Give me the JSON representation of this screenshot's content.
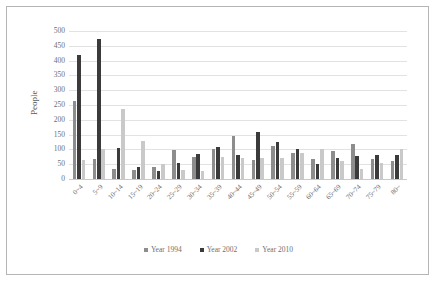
{
  "chart_data": {
    "type": "bar",
    "title": "",
    "xlabel": "",
    "ylabel": "People",
    "ylim": [
      0,
      500
    ],
    "yticks": [
      500,
      450,
      400,
      350,
      300,
      250,
      200,
      150,
      100,
      50,
      0
    ],
    "grid": true,
    "legend_position": "bottom-center",
    "categories": [
      "0~4",
      "5~9",
      "10~14",
      "15~19",
      "20~24",
      "25~29",
      "30~34",
      "35~39",
      "40~44",
      "45~49",
      "50~54",
      "55~59",
      "60~64",
      "65~69",
      "70~74",
      "75~79",
      "80~"
    ],
    "series": [
      {
        "name": "Year 1994",
        "color": "#8d8d8d",
        "values": [
          265,
          68,
          33,
          30,
          42,
          97,
          75,
          100,
          145,
          65,
          110,
          88,
          68,
          95,
          117,
          68,
          62
        ]
      },
      {
        "name": "Year 2002",
        "color": "#3b3b3b",
        "values": [
          420,
          472,
          105,
          40,
          26,
          55,
          85,
          108,
          82,
          158,
          125,
          100,
          50,
          70,
          78,
          80,
          80
        ]
      },
      {
        "name": "Year 2010",
        "color": "#c9c9c9",
        "values": [
          65,
          103,
          238,
          128,
          52,
          32,
          28,
          75,
          72,
          72,
          70,
          88,
          100,
          60,
          35,
          55,
          100
        ]
      }
    ]
  },
  "legend": {
    "items": [
      {
        "label": "Year 1994",
        "color": "#8d8d8d"
      },
      {
        "label": "Year 2002",
        "color": "#3b3b3b"
      },
      {
        "label": "Year 2010",
        "color": "#c9c9c9"
      }
    ]
  }
}
